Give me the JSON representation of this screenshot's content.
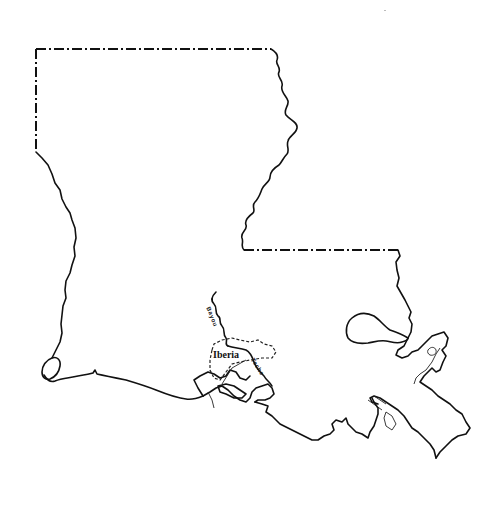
{
  "map": {
    "subject": "Louisiana state outline",
    "style": "black line drawing on white",
    "colors": {
      "background": "#ffffff",
      "line": "#111111"
    },
    "highlighted_region": {
      "label": "Iberia",
      "boundary_style": "dashed"
    },
    "waterway_labels": {
      "upper": "Bayou",
      "lower": "Teche"
    },
    "boundaries": {
      "state_border_style": "dash-dot",
      "rivers_and_coast_style": "solid"
    }
  }
}
